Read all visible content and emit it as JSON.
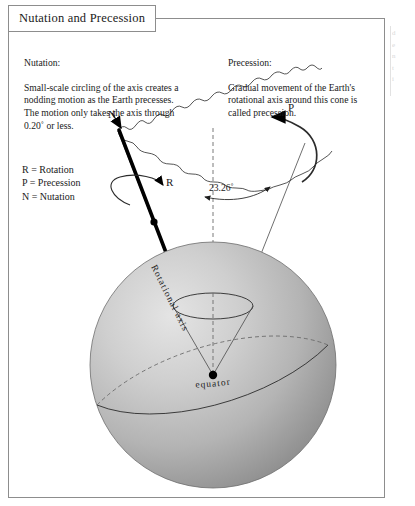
{
  "figure": {
    "title": "Nutation and Precession",
    "nutation": {
      "heading": "Nutation:",
      "body": "Small-scale circling of the axis creates a nodding motion as the Earth precesses. The motion only takes the axis through 0.20˚ or less."
    },
    "precession": {
      "heading": "Precession:",
      "body": "Gradual movement of the Earth's rotational axis around this cone is called precession."
    },
    "legend": "R = Rotation\nP = Precession\nN = Nutation",
    "labels": {
      "nutation_marker": "N",
      "precession_marker": "P",
      "rotation_marker": "R",
      "tilt_angle": "23.26˚",
      "rotational_axis": "Rotational axis",
      "equator": "equator"
    },
    "edge_fragment": "d\ne\nn\nt\ni"
  },
  "colors": {
    "frame": "#8d8d8d",
    "text": "#1a1a1a",
    "axis": "#000000",
    "sphere_light": "#d9d9d9",
    "sphere_dark": "#8e8e8e",
    "dashed": "#6b6b6b"
  }
}
